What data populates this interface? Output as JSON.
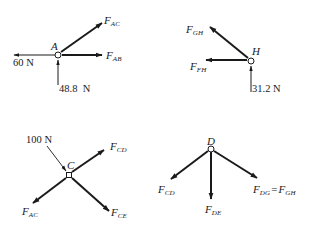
{
  "diagram": {
    "type": "free-body diagrams of truss joints",
    "stroke_color": "#1a1a1a",
    "background_color": "#ffffff",
    "joints": [
      {
        "id": "A",
        "label": "A",
        "known_loads": [
          {
            "label": "60 N",
            "direction": "left"
          },
          {
            "label": "48.8  N",
            "direction": "up"
          }
        ],
        "unknown_forces": [
          {
            "symbol": "F",
            "subscript": "AC",
            "direction": "up-right"
          },
          {
            "symbol": "F",
            "subscript": "AB",
            "direction": "right"
          }
        ]
      },
      {
        "id": "H",
        "label": "H",
        "known_loads": [
          {
            "label": "31.2 N",
            "direction": "up"
          }
        ],
        "unknown_forces": [
          {
            "symbol": "F",
            "subscript": "GH",
            "direction": "up-left"
          },
          {
            "symbol": "F",
            "subscript": "FH",
            "direction": "left"
          }
        ]
      },
      {
        "id": "C",
        "label": "C",
        "known_loads": [
          {
            "label": "100 N",
            "direction": "down-right"
          }
        ],
        "unknown_forces": [
          {
            "symbol": "F",
            "subscript": "CD",
            "direction": "up-right"
          },
          {
            "symbol": "F",
            "subscript": "AC",
            "direction": "down-left"
          },
          {
            "symbol": "F",
            "subscript": "CE",
            "direction": "down-right"
          }
        ]
      },
      {
        "id": "D",
        "label": "D",
        "known_loads": [],
        "unknown_forces": [
          {
            "symbol": "F",
            "subscript": "CD",
            "direction": "down-left"
          },
          {
            "symbol": "F",
            "subscript": "DE",
            "direction": "down"
          },
          {
            "symbol": "F",
            "subscript": "DG",
            "direction": "down-right",
            "equals": {
              "symbol": "F",
              "subscript": "GH"
            },
            "equals_sign": "="
          }
        ]
      }
    ]
  }
}
